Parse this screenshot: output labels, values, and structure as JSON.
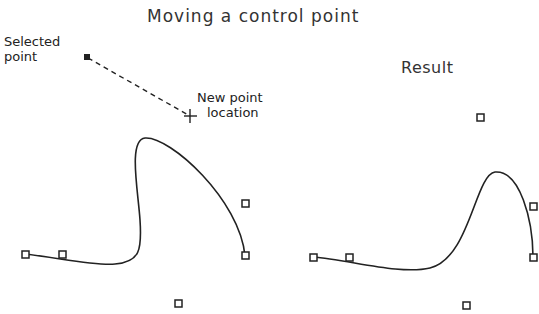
{
  "title": "Moving a control point",
  "left_panel": {
    "selected_label_line1": "Selected",
    "selected_label_line2": "point",
    "new_location_line1": "New point",
    "new_location_line2": "location",
    "selected_point": [
      87,
      57
    ],
    "new_point": [
      190,
      116
    ],
    "control_points": [
      [
        25,
        254
      ],
      [
        62,
        255
      ],
      [
        178,
        303
      ],
      [
        245,
        203
      ],
      [
        245,
        256
      ]
    ]
  },
  "right_panel": {
    "title": "Result",
    "control_points": [
      [
        313,
        257
      ],
      [
        349,
        258
      ],
      [
        466,
        306
      ],
      [
        480,
        117
      ],
      [
        533,
        206
      ],
      [
        533,
        258
      ]
    ]
  },
  "colors": {
    "stroke": "#222222",
    "background": "#ffffff"
  }
}
